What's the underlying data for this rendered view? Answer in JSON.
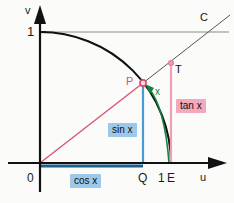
{
  "figure": {
    "background_color": "#fbfbfa",
    "width": 234,
    "height": 203
  },
  "axes": {
    "x_axis_label": "u",
    "y_axis_label": "v",
    "origin_label": "0",
    "y_tick_label": "1",
    "x_tick_label": "1",
    "axis_color": "#111111",
    "arrow_style": "solid-triangle"
  },
  "points": [
    {
      "name": "O",
      "label": "0",
      "x": 40,
      "y": 163,
      "color": "#111111",
      "marker": false
    },
    {
      "name": "Q",
      "label": "Q",
      "x": 143,
      "y": 163,
      "color": "#111111",
      "marker": false
    },
    {
      "name": "E",
      "label": "E",
      "x": 171,
      "y": 163,
      "color": "#111111",
      "marker": false
    },
    {
      "name": "P",
      "label": "P",
      "x": 143,
      "y": 83,
      "color": "#d94a6e",
      "marker": true
    },
    {
      "name": "T",
      "label": "T",
      "x": 171,
      "y": 63,
      "color": "#d94a6e",
      "marker": true
    },
    {
      "name": "C",
      "label": "C",
      "x": 205,
      "y": 18,
      "color": "#111111",
      "marker": false
    }
  ],
  "segments": {
    "cos_x": {
      "label": "cos x",
      "color": "#1d5f8a",
      "from": "O",
      "to": "Q",
      "orientation": "horizontal",
      "value_meaning": "adjacent / x-coordinate of P"
    },
    "sin_x": {
      "label": "sin x",
      "color": "#4a9bd1",
      "from": "Q",
      "to": "P",
      "orientation": "vertical",
      "value_meaning": "opposite / y-coordinate of P"
    },
    "tan_x": {
      "label": "tan x",
      "color": "#f0a0b4",
      "from": "E",
      "to": "T",
      "orientation": "vertical",
      "value_meaning": "tangent segment at u = 1"
    },
    "arc_x": {
      "label": "x",
      "color": "#16803c",
      "from": "E",
      "to": "P",
      "orientation": "arc",
      "value_meaning": "arc length = angle x in radians"
    }
  },
  "curves": {
    "unit_circle": {
      "name": "unit-circle-arc",
      "color": "#111111",
      "description": "quarter arc of the unit circle from (0,1) to (1,0)"
    },
    "ray": {
      "name": "ray-through-P",
      "color": "#d9566f",
      "description": "ray from origin through P continuing to T and C"
    },
    "level_one_line": {
      "name": "horizontal-line-v-equals-1",
      "color": "#8a8a8a",
      "description": "horizontal line at v = 1 passing through C"
    }
  },
  "colors": {
    "axis": "#111111",
    "circle": "#111111",
    "ray_pink": "#d9566f",
    "cos_blue": "#1d5f8a",
    "sin_blue": "#4a9bd1",
    "tan_pink": "#f0a0b4",
    "arc_green": "#16803c",
    "gridline_gray": "#8a8a8a",
    "label_box_blue": "#9dc8e8",
    "label_box_pink": "#f2a8bd"
  }
}
